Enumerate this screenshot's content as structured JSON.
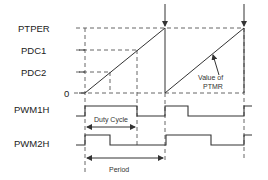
{
  "diagram": {
    "y_labels": {
      "ptper": "PTPER",
      "pdc1": "PDC1",
      "pdc2": "PDC2",
      "zero": "0"
    },
    "signal_labels": {
      "pwm1h": "PWM1H",
      "pwm2h": "PWM2H"
    },
    "annotations": {
      "value_of_line1": "Value of",
      "value_of_line2": "PTMR",
      "duty_cycle": "Duty Cycle",
      "period": "Period"
    },
    "colors": {
      "line": "#333333",
      "dash": "#555555",
      "background": "#ffffff"
    }
  }
}
